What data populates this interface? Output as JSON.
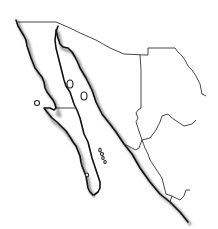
{
  "map": {
    "title": "",
    "type": "blank outline map",
    "region_depicted": "Northwestern Mexico",
    "features": [
      {
        "name": "baja-california-peninsula",
        "kind": "coastline"
      },
      {
        "name": "mainland-pacific-coast",
        "kind": "coastline"
      },
      {
        "name": "state-borders",
        "kind": "border"
      },
      {
        "name": "gulf-islands",
        "kind": "islands"
      }
    ],
    "colors": {
      "background": "#ffffff",
      "coastline": "#111111",
      "border": "#333333",
      "shadow": "#555555"
    },
    "labels": []
  }
}
